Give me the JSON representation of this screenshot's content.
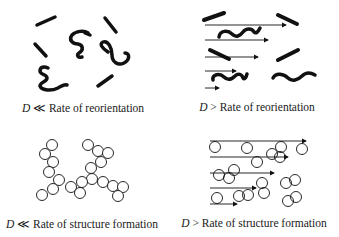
{
  "diagram": {
    "panels": [
      {
        "id": "top-left",
        "caption": {
          "symbol": "D",
          "relation": "≪",
          "text": "Rate of reorientation"
        },
        "particles": "rods-and-coils",
        "flow_arrows": false
      },
      {
        "id": "top-right",
        "caption": {
          "symbol": "D",
          "relation": ">",
          "text": "Rate of reorientation"
        },
        "particles": "rods-and-coils",
        "flow_arrows": true
      },
      {
        "id": "bottom-left",
        "caption": {
          "symbol": "D",
          "relation": "≪",
          "text": "Rate of structure formation"
        },
        "particles": "spheres-aggregated",
        "flow_arrows": false
      },
      {
        "id": "bottom-right",
        "caption": {
          "symbol": "D",
          "relation": ">",
          "text": "Rate of structure formation"
        },
        "particles": "spheres-dispersed",
        "flow_arrows": true
      }
    ],
    "colors": {
      "ink": "#111111",
      "background": "#ffffff"
    }
  }
}
